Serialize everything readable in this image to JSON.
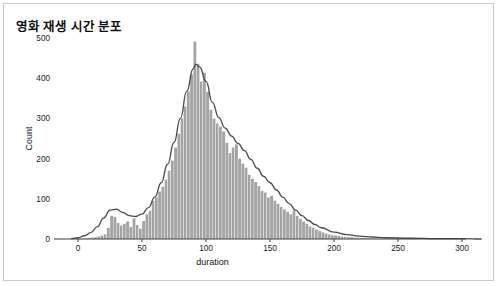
{
  "figure": {
    "title": "영화 재생 시간 분포",
    "background_color": "#ffffff",
    "border_color": "#c9c9c9"
  },
  "chart_data": {
    "type": "bar",
    "title": "영화 재생 시간 분포",
    "subtitle": "",
    "xlabel": "duration",
    "ylabel": "Count",
    "xlim": [
      -10,
      320
    ],
    "ylim": [
      0,
      520
    ],
    "xticks": [
      0,
      50,
      100,
      150,
      200,
      250,
      300
    ],
    "xticklabels": [
      "0",
      "50",
      "100",
      "150",
      "200",
      "250",
      "300"
    ],
    "yticks": [
      0,
      100,
      200,
      300,
      400,
      500
    ],
    "yticklabels": [
      "0",
      "100",
      "200",
      "300",
      "400",
      "500"
    ],
    "grid": false,
    "legend": null,
    "legend_position": "none",
    "bar_color": "#a3a3a3",
    "bar_edge_color": "#ffffff",
    "kde_color": "#4c4c4c",
    "bin_width": 2.5,
    "bin_starts": [
      0,
      2.5,
      5,
      7.5,
      10,
      12.5,
      15,
      17.5,
      20,
      22.5,
      25,
      27.5,
      30,
      32.5,
      35,
      37.5,
      40,
      42.5,
      45,
      47.5,
      50,
      52.5,
      55,
      57.5,
      60,
      62.5,
      65,
      67.5,
      70,
      72.5,
      75,
      77.5,
      80,
      82.5,
      85,
      87.5,
      90,
      92.5,
      95,
      97.5,
      100,
      102.5,
      105,
      107.5,
      110,
      112.5,
      115,
      117.5,
      120,
      122.5,
      125,
      127.5,
      130,
      132.5,
      135,
      137.5,
      140,
      142.5,
      145,
      147.5,
      150,
      152.5,
      155,
      157.5,
      160,
      162.5,
      165,
      167.5,
      170,
      172.5,
      175,
      177.5,
      180,
      182.5,
      185,
      187.5,
      190,
      192.5,
      195,
      197.5,
      200,
      202.5,
      205,
      207.5,
      210,
      212.5,
      215,
      217.5,
      220,
      222.5,
      225,
      227.5,
      230,
      232.5,
      235
    ],
    "counts": [
      1,
      1,
      2,
      3,
      4,
      5,
      7,
      9,
      12,
      28,
      58,
      55,
      40,
      34,
      38,
      44,
      30,
      52,
      35,
      26,
      45,
      62,
      70,
      95,
      104,
      118,
      130,
      148,
      170,
      196,
      228,
      262,
      300,
      330,
      368,
      410,
      492,
      436,
      392,
      414,
      366,
      322,
      300,
      288,
      280,
      268,
      240,
      214,
      228,
      236,
      200,
      188,
      178,
      160,
      150,
      142,
      132,
      120,
      116,
      104,
      108,
      96,
      88,
      80,
      74,
      68,
      62,
      72,
      58,
      50,
      44,
      38,
      32,
      28,
      24,
      20,
      17,
      14,
      12,
      10,
      9,
      8,
      7,
      6,
      5,
      5,
      4,
      4,
      3,
      3,
      2,
      2,
      2,
      1,
      1
    ],
    "kde_x": [
      -5,
      0,
      5,
      10,
      15,
      20,
      25,
      30,
      35,
      40,
      45,
      50,
      55,
      60,
      65,
      70,
      75,
      80,
      85,
      90,
      92,
      95,
      100,
      105,
      110,
      115,
      120,
      125,
      130,
      135,
      140,
      145,
      150,
      155,
      160,
      165,
      170,
      175,
      180,
      185,
      190,
      200,
      210,
      220,
      230,
      240,
      260,
      280,
      300,
      315
    ],
    "kde_y": [
      1,
      3,
      8,
      16,
      30,
      52,
      72,
      74,
      66,
      58,
      56,
      62,
      78,
      104,
      140,
      186,
      240,
      300,
      368,
      424,
      435,
      428,
      392,
      340,
      302,
      276,
      256,
      238,
      220,
      198,
      176,
      156,
      140,
      122,
      104,
      88,
      72,
      58,
      46,
      36,
      28,
      17,
      11,
      7,
      5,
      3,
      2,
      1,
      1,
      0
    ]
  }
}
